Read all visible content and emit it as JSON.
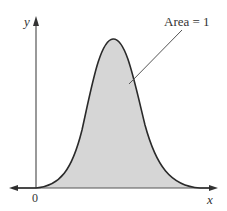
{
  "diagram": {
    "type": "probability-density-curve",
    "axes": {
      "x_label": "x",
      "y_label": "y",
      "origin_label": "0"
    },
    "annotation": {
      "text": "Area = 1"
    },
    "colors": {
      "fill": "#d6d6d6",
      "curve": "#2a2a2a",
      "axis": "#555555",
      "text": "#333333"
    }
  }
}
